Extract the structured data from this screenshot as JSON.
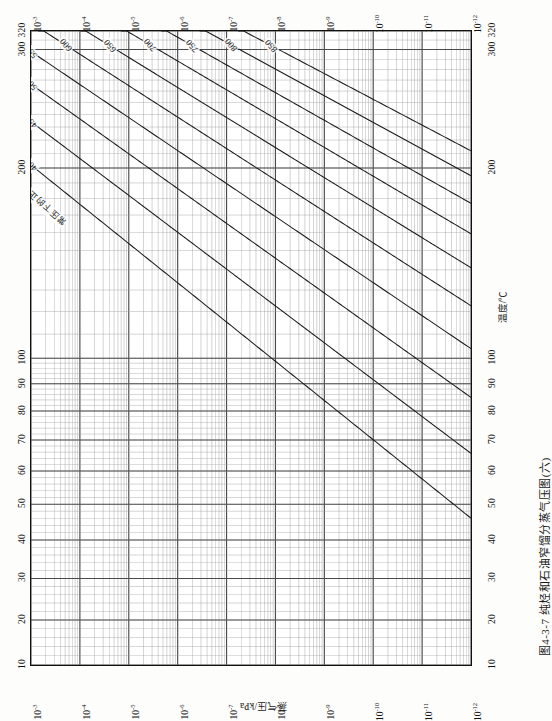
{
  "figure": {
    "caption": "图4-3-7  纯烃和石油窄馏分蒸气压图(六)",
    "temperature_axis_title": "温度/℃",
    "pressure_axis_title": "蒸气压/kPa",
    "in_plot_note": "常压下的正常沸点温度(℃)"
  },
  "axes": {
    "temperature_ticks": [
      "10",
      "20",
      "30",
      "40",
      "50",
      "60",
      "70",
      "80",
      "90",
      "100",
      "200",
      "300",
      "320"
    ],
    "pressure_exponents": [
      "-3",
      "-4",
      "-5",
      "-6",
      "-7",
      "-8",
      "-9",
      "-10",
      "-11",
      "-12"
    ],
    "pressure_mantissa": "10"
  },
  "chart_data": {
    "type": "line",
    "title": "图4-3-7  纯烃和石油窄馏分蒸气压图(六)",
    "subtitle": "Cox chart — vapour pressure of pure hydrocarbons and narrow petroleum fractions",
    "xlabel": "蒸气压/kPa",
    "ylabel": "温度/℃",
    "xscale": "log",
    "yscale": "cox",
    "xlim": [
      0.001,
      1e-12
    ],
    "ylim": [
      10,
      320
    ],
    "grid": true,
    "legend": "none",
    "x_tick_labels": [
      "10^-3",
      "10^-4",
      "10^-5",
      "10^-6",
      "10^-7",
      "10^-8",
      "10^-9",
      "10^-10",
      "10^-11",
      "10^-12"
    ],
    "y_tick_labels": [
      "10",
      "20",
      "30",
      "40",
      "50",
      "60",
      "70",
      "80",
      "90",
      "100",
      "200",
      "300",
      "320"
    ],
    "annotations": [
      "常压下的正常沸点温度(℃)"
    ],
    "series": [
      {
        "name": "400",
        "label": "400",
        "normal_boiling_point_C": 400
      },
      {
        "name": "450",
        "label": "450",
        "normal_boiling_point_C": 450
      },
      {
        "name": "500",
        "label": "500",
        "normal_boiling_point_C": 500
      },
      {
        "name": "550",
        "label": "550",
        "normal_boiling_point_C": 550
      },
      {
        "name": "600",
        "label": "600",
        "normal_boiling_point_C": 600
      },
      {
        "name": "650",
        "label": "650",
        "normal_boiling_point_C": 650
      },
      {
        "name": "700",
        "label": "700",
        "normal_boiling_point_C": 700
      },
      {
        "name": "750",
        "label": "750",
        "normal_boiling_point_C": 750
      },
      {
        "name": "800",
        "label": "800",
        "normal_boiling_point_C": 800
      },
      {
        "name": "850",
        "label": "850",
        "normal_boiling_point_C": 850
      }
    ],
    "curve_labels": [
      "400",
      "450",
      "500",
      "550",
      "600",
      "650",
      "700",
      "750",
      "800",
      "850"
    ]
  },
  "colors": {
    "ink": "#111111",
    "grid_major": "#4a4a4a",
    "grid_minor": "#9a9a9a",
    "paper": "#ffffff",
    "page": "#fdfdfb"
  }
}
